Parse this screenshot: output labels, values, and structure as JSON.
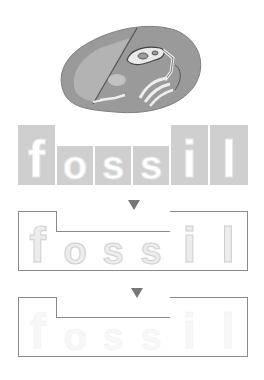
{
  "illustration": {
    "name": "fossil-rock",
    "description": "grey rock with dinosaur skeleton fossil"
  },
  "word": "fossil",
  "colors": {
    "row1_fill": "#cfcfcf",
    "border": "#8a8a8a",
    "arrow": "#777777"
  },
  "rows": [
    {
      "style": "filled-dotted",
      "letters": [
        "f",
        "o",
        "s",
        "s",
        "i",
        "l"
      ]
    },
    {
      "style": "outlined-faint",
      "letters": [
        "f",
        "o",
        "s",
        "s",
        "i",
        "l"
      ]
    },
    {
      "style": "outlined-very-faint",
      "letters": [
        "f",
        "o",
        "s",
        "s",
        "i",
        "l"
      ]
    }
  ],
  "letter_shapes": [
    "tall",
    "short",
    "short",
    "short",
    "tall",
    "tall"
  ]
}
